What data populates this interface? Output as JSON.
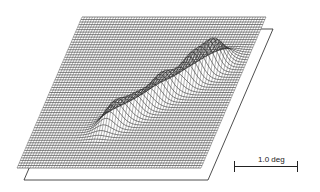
{
  "figure": {
    "type": "3d-wireframe-surface",
    "colors": {
      "line": "#222222",
      "background": "#ffffff"
    }
  },
  "scale_bar": {
    "label": "1.0 deg"
  }
}
